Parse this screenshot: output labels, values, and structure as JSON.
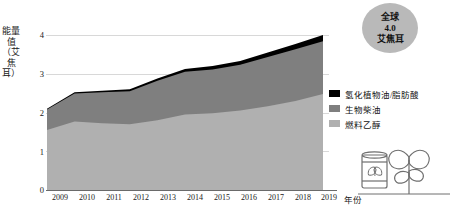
{
  "chart_data": {
    "type": "area",
    "title": "",
    "subtitle": "",
    "xlabel": "年份",
    "ylabel": "能量值（艾焦耳）",
    "categories": [
      "2009",
      "2010",
      "2011",
      "2012",
      "2013",
      "2014",
      "2015",
      "2016",
      "2017",
      "2018",
      "2019"
    ],
    "ylim": [
      0,
      4
    ],
    "yticks": [
      "0",
      "1",
      "2",
      "3",
      "4"
    ],
    "grid": true,
    "stacked": true,
    "legend_position": "right",
    "series": [
      {
        "name": "燃料乙醇",
        "color": "#b0b0b0",
        "values": [
          1.55,
          1.77,
          1.72,
          1.7,
          1.8,
          1.95,
          1.98,
          2.05,
          2.16,
          2.3,
          2.48
        ]
      },
      {
        "name": "生物柴油",
        "color": "#7f7f7f",
        "values": [
          0.53,
          0.72,
          0.8,
          0.85,
          1.02,
          1.1,
          1.13,
          1.18,
          1.27,
          1.33,
          1.36
        ]
      },
      {
        "name": "氢化植物油/脂肪酸",
        "color": "#000000",
        "values": [
          0.02,
          0.03,
          0.04,
          0.05,
          0.06,
          0.07,
          0.09,
          0.1,
          0.12,
          0.14,
          0.16
        ]
      }
    ],
    "totals": [
      2.1,
      2.52,
      2.56,
      2.6,
      2.88,
      3.12,
      3.2,
      3.33,
      3.55,
      3.77,
      4.0
    ],
    "annotation": {
      "line1": "全球",
      "line2": "4.0",
      "line3": "艾焦耳"
    }
  },
  "legend": {
    "items": [
      {
        "label": "氢化植物油/脂肪酸",
        "color": "#000000"
      },
      {
        "label": "生物柴油",
        "color": "#7f7f7f"
      },
      {
        "label": "燃料乙醇",
        "color": "#b0b0b0"
      }
    ]
  },
  "axes": {
    "y_title": "能量值（艾焦耳）",
    "x_title": "年份",
    "y_ticks": [
      "4",
      "3",
      "2",
      "1",
      "0"
    ],
    "x_ticks": [
      "2009",
      "2010",
      "2011",
      "2012",
      "2013",
      "2014",
      "2015",
      "2016",
      "2017",
      "2018",
      "2019"
    ]
  },
  "callout": {
    "line1": "全球",
    "line2": "4.0",
    "line3": "艾焦耳"
  },
  "icons": {
    "barrel": "oil-barrel-leaf-icon",
    "plant": "plant-leaf-icon"
  }
}
